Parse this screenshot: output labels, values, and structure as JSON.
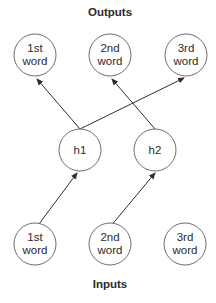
{
  "diagram": {
    "title_top": "Outputs",
    "title_bottom": "Inputs",
    "outputs": [
      {
        "line1": "1st",
        "line2": "word"
      },
      {
        "line1": "2nd",
        "line2": "word"
      },
      {
        "line1": "3rd",
        "line2": "word"
      }
    ],
    "hidden": [
      {
        "label": "h1"
      },
      {
        "label": "h2"
      }
    ],
    "inputs": [
      {
        "line1": "1st",
        "line2": "word"
      },
      {
        "line1": "2nd",
        "line2": "word"
      },
      {
        "line1": "3rd",
        "line2": "word"
      }
    ],
    "edges": [
      {
        "from": "input-1st",
        "to": "h1"
      },
      {
        "from": "input-2nd",
        "to": "h2"
      },
      {
        "from": "h1",
        "to": "output-1st"
      },
      {
        "from": "h1",
        "to": "output-3rd"
      },
      {
        "from": "h2",
        "to": "output-2nd"
      }
    ]
  }
}
